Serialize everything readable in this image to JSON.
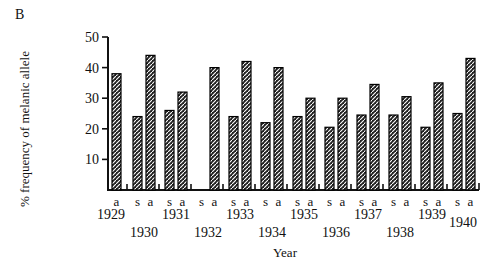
{
  "panel_label": "B",
  "chart_data": {
    "type": "bar",
    "title": "",
    "xlabel": "Year",
    "ylabel": "% frequency of melanic allele",
    "ylim": [
      0,
      50
    ],
    "yticks": [
      10,
      20,
      30,
      40,
      50
    ],
    "grid": false,
    "legend": null,
    "bar_style": {
      "fill": "#222222",
      "hatch": "diagonal white",
      "border": "#000000"
    },
    "sub_categories": {
      "s": "s",
      "a": "a"
    },
    "categories": [
      "1929",
      "1930",
      "1931",
      "1932",
      "1933",
      "1934",
      "1935",
      "1936",
      "1937",
      "1938",
      "1939",
      "1940"
    ],
    "series": [
      {
        "name": "s",
        "values": [
          null,
          24,
          26,
          null,
          24,
          22,
          24,
          20.5,
          24.5,
          24.5,
          20.5,
          25
        ]
      },
      {
        "name": "a",
        "values": [
          38,
          44,
          32,
          40,
          42,
          40,
          30,
          30,
          34.5,
          30.5,
          35,
          43
        ]
      }
    ],
    "bars": [
      {
        "year": "1929",
        "label": "a",
        "value": 38
      },
      {
        "year": "1930",
        "label": "s",
        "value": 24
      },
      {
        "year": "1930",
        "label": "a",
        "value": 44
      },
      {
        "year": "1931",
        "label": "s",
        "value": 26
      },
      {
        "year": "1931",
        "label": "a",
        "value": 32
      },
      {
        "year": "1932",
        "label": "s",
        "value": null
      },
      {
        "year": "1932",
        "label": "a",
        "value": 40
      },
      {
        "year": "1933",
        "label": "s",
        "value": 24
      },
      {
        "year": "1933",
        "label": "a",
        "value": 42
      },
      {
        "year": "1934",
        "label": "s",
        "value": 22
      },
      {
        "year": "1934",
        "label": "a",
        "value": 40
      },
      {
        "year": "1935",
        "label": "s",
        "value": 24
      },
      {
        "year": "1935",
        "label": "a",
        "value": 30
      },
      {
        "year": "1936",
        "label": "s",
        "value": 20.5
      },
      {
        "year": "1936",
        "label": "a",
        "value": 30
      },
      {
        "year": "1937",
        "label": "s",
        "value": 24.5
      },
      {
        "year": "1937",
        "label": "a",
        "value": 34.5
      },
      {
        "year": "1938",
        "label": "s",
        "value": 24.5
      },
      {
        "year": "1938",
        "label": "a",
        "value": 30.5
      },
      {
        "year": "1939",
        "label": "s",
        "value": 20.5
      },
      {
        "year": "1939",
        "label": "a",
        "value": 35
      },
      {
        "year": "1940",
        "label": "s",
        "value": 25
      },
      {
        "year": "1940",
        "label": "a",
        "value": 43
      }
    ]
  }
}
